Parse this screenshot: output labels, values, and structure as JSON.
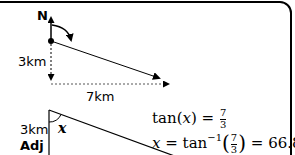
{
  "diagram": {
    "top": {
      "north_label": "N",
      "vertical_distance": "3km",
      "horizontal_distance": "7km"
    },
    "triangle": {
      "side_label": "3km",
      "side_role": "Adj",
      "angle_label": "x"
    },
    "equations": {
      "line1": {
        "lhs_func": "tan",
        "lhs_var": "x",
        "equals": "=",
        "num": "7",
        "den": "3"
      },
      "line2": {
        "var": "x",
        "equals": "=",
        "func": "tan",
        "exp": "−1",
        "num": "7",
        "den": "3",
        "equals2": "=",
        "result": "66.8º"
      }
    }
  }
}
